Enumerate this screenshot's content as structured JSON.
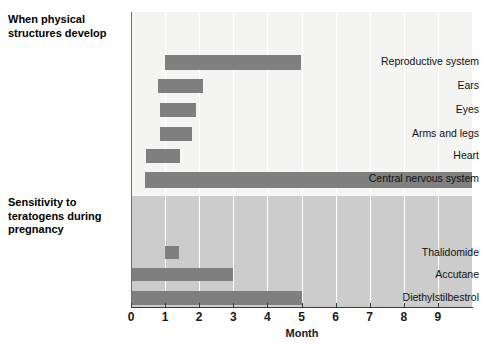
{
  "chart_data": {
    "type": "bar",
    "orientation": "horizontal",
    "title": "",
    "xlabel": "Month",
    "ylabel": "",
    "xlim": [
      0,
      10
    ],
    "xticks": [
      0,
      1,
      2,
      3,
      4,
      5,
      6,
      7,
      8,
      9
    ],
    "xtick_labels": [
      "0",
      "1",
      "2",
      "3",
      "4",
      "5",
      "6",
      "7",
      "8",
      "9"
    ],
    "grid": "vertical-white",
    "legend": "none",
    "sections": [
      {
        "header": "When physical\nstructures develop",
        "header_lines": [
          "When physical",
          "structures develop"
        ],
        "background": "#f4f4f2",
        "categories": [
          "Reproductive system",
          "Ears",
          "Eyes",
          "Arms and legs",
          "Heart",
          "Central nervous system"
        ],
        "bars": [
          {
            "label": "Reproductive system",
            "start": 1.0,
            "end": 5.0
          },
          {
            "label": "Ears",
            "start": 0.8,
            "end": 2.1
          },
          {
            "label": "Eyes",
            "start": 0.85,
            "end": 1.9
          },
          {
            "label": "Arms and legs",
            "start": 0.85,
            "end": 1.8
          },
          {
            "label": "Heart",
            "start": 0.45,
            "end": 1.45
          },
          {
            "label": "Central nervous system",
            "start": 0.4,
            "end": 10.0
          }
        ]
      },
      {
        "header": "Sensitivity to\nteratogens during\npregnancy",
        "header_lines": [
          "Sensitivity to",
          "teratogens during",
          "pregnancy"
        ],
        "background": "#cccccc",
        "categories": [
          "Thalidomide",
          "Accutane",
          "Diethylstilbestrol"
        ],
        "bars": [
          {
            "label": "Thalidomide",
            "start": 1.0,
            "end": 1.4
          },
          {
            "label": "Accutane",
            "start": 0.0,
            "end": 3.0
          },
          {
            "label": "Diethylstilbestrol",
            "start": 0.0,
            "end": 5.0
          }
        ]
      }
    ],
    "colors": {
      "bar": "#7f7f7f",
      "upper_background": "#f4f4f2",
      "lower_background": "#cccccc",
      "gridline": "#ffffff",
      "axis": "#3a3a3a",
      "text": "#111111"
    }
  },
  "axis": {
    "title": "Month",
    "ticks": [
      "0",
      "1",
      "2",
      "3",
      "4",
      "5",
      "6",
      "7",
      "8",
      "9"
    ]
  },
  "section1": {
    "header_line1": "When physical",
    "header_line2": "structures develop",
    "labels": {
      "reproductive": "Reproductive system",
      "ears": "Ears",
      "eyes": "Eyes",
      "arms_legs": "Arms and legs",
      "heart": "Heart",
      "cns": "Central nervous system"
    }
  },
  "section2": {
    "header_line1": "Sensitivity to",
    "header_line2": "teratogens during",
    "header_line3": "pregnancy",
    "labels": {
      "thalidomide": "Thalidomide",
      "accutane": "Accutane",
      "des": "Diethylstilbestrol"
    }
  }
}
